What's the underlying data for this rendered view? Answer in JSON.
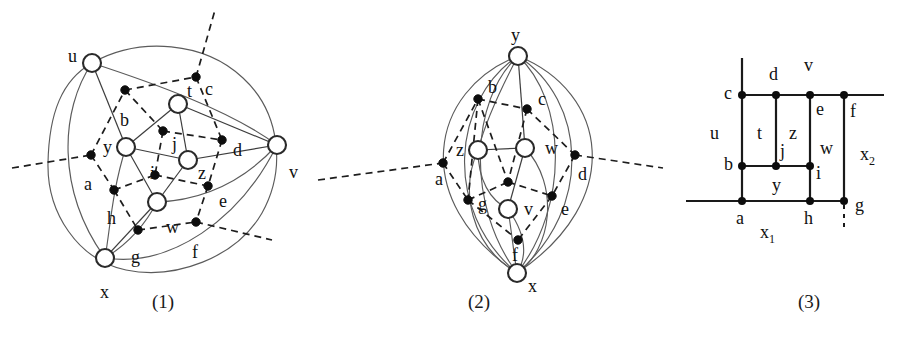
{
  "figure": {
    "kind": "three-panel graph embedding diagram",
    "captions": [
      {
        "text": "(1)",
        "x": 152,
        "y": 300
      },
      {
        "text": "(2)",
        "x": 468,
        "y": 300
      },
      {
        "text": "(3)",
        "x": 798,
        "y": 300
      }
    ]
  },
  "panel1": {
    "caption": "(1)",
    "vertices": [
      {
        "id": "u",
        "label": "u",
        "cx": 92,
        "cy": 63,
        "r": 9,
        "lx": 68,
        "ly": 47
      },
      {
        "id": "t",
        "label": "t",
        "cx": 178,
        "cy": 104,
        "r": 9,
        "lx": 187,
        "ly": 82
      },
      {
        "id": "y",
        "label": "y",
        "cx": 126,
        "cy": 147,
        "r": 9,
        "lx": 103,
        "ly": 138
      },
      {
        "id": "z",
        "label": "z",
        "cx": 188,
        "cy": 160,
        "r": 9,
        "lx": 198,
        "ly": 164
      },
      {
        "id": "v",
        "label": "v",
        "cx": 277,
        "cy": 145,
        "r": 9,
        "lx": 289,
        "ly": 163
      },
      {
        "id": "w",
        "label": "w",
        "cx": 157,
        "cy": 202,
        "r": 9,
        "lx": 166,
        "ly": 218
      },
      {
        "id": "x",
        "label": "x",
        "cx": 105,
        "cy": 258,
        "r": 9,
        "lx": 100,
        "ly": 283
      }
    ],
    "edge_dots": [
      {
        "id": "a",
        "label": "a",
        "cx": 91,
        "cy": 155,
        "lx": 84,
        "ly": 175
      },
      {
        "id": "b",
        "label": "b",
        "cx": 125,
        "cy": 90,
        "lx": 120,
        "ly": 111
      },
      {
        "id": "c",
        "label": "c",
        "cx": 196,
        "cy": 77,
        "lx": 205,
        "ly": 80
      },
      {
        "id": "d",
        "label": "d",
        "cx": 222,
        "cy": 140,
        "lx": 233,
        "ly": 141
      },
      {
        "id": "e",
        "label": "e",
        "cx": 208,
        "cy": 186,
        "lx": 219,
        "ly": 192
      },
      {
        "id": "f",
        "label": "f",
        "cx": 196,
        "cy": 222,
        "lx": 192,
        "ly": 243
      },
      {
        "id": "g",
        "label": "g",
        "cx": 138,
        "cy": 230,
        "lx": 131,
        "ly": 248
      },
      {
        "id": "h",
        "label": "h",
        "cx": 114,
        "cy": 190,
        "lx": 107,
        "ly": 209
      },
      {
        "id": "i",
        "label": "i",
        "cx": 155,
        "cy": 175,
        "lx": 150,
        "ly": 164
      },
      {
        "id": "j",
        "label": "j",
        "cx": 163,
        "cy": 131,
        "lx": 172,
        "ly": 135
      }
    ]
  },
  "panel2": {
    "caption": "(2)",
    "vertices": [
      {
        "id": "y",
        "label": "y",
        "cx": 518,
        "cy": 56,
        "r": 9,
        "lx": 511,
        "ly": 38
      },
      {
        "id": "z",
        "label": "z",
        "cx": 478,
        "cy": 150,
        "r": 9,
        "lx": 458,
        "ly": 153
      },
      {
        "id": "w",
        "label": "w",
        "cx": 525,
        "cy": 148,
        "r": 9,
        "lx": 545,
        "ly": 150
      },
      {
        "id": "v",
        "label": "v",
        "cx": 508,
        "cy": 209,
        "r": 9,
        "lx": 524,
        "ly": 213
      },
      {
        "id": "x",
        "label": "x",
        "cx": 517,
        "cy": 273,
        "r": 9,
        "lx": 527,
        "ly": 290
      }
    ],
    "edge_dots": [
      {
        "id": "a",
        "label": "a",
        "cx": 443,
        "cy": 163,
        "lx": 437,
        "ly": 183
      },
      {
        "id": "b",
        "label": "b",
        "cx": 478,
        "cy": 99,
        "lx": 489,
        "ly": 92
      },
      {
        "id": "c",
        "label": "c",
        "cx": 527,
        "cy": 109,
        "lx": 538,
        "ly": 103
      },
      {
        "id": "d",
        "label": "d",
        "cx": 575,
        "cy": 155,
        "lx": 578,
        "ly": 178
      },
      {
        "id": "e",
        "label": "e",
        "cx": 552,
        "cy": 196,
        "lx": 561,
        "ly": 212
      },
      {
        "id": "f",
        "label": "f",
        "cx": 518,
        "cy": 240,
        "lx": 513,
        "ly": 261
      },
      {
        "id": "g",
        "label": "g",
        "cx": 468,
        "cy": 200,
        "lx": 478,
        "ly": 207
      },
      {
        "id": "n",
        "label": "",
        "cx": 508,
        "cy": 182,
        "lx": 0,
        "ly": 0
      }
    ]
  },
  "panel3": {
    "caption": "(3)",
    "grid_nodes": [
      {
        "id": "c",
        "label": "c",
        "cx": 742,
        "cy": 95,
        "lx": 727,
        "ly": 90
      },
      {
        "id": "d",
        "label": "d",
        "cx": 776,
        "cy": 95,
        "lx": 770,
        "ly": 78
      },
      {
        "id": "v",
        "label": "v",
        "cx": 810,
        "cy": 95,
        "lx": 805,
        "ly": 70
      },
      {
        "id": "e",
        "label": "e",
        "cx": 810,
        "cy": 95,
        "lx": 816,
        "ly": 110
      },
      {
        "id": "f",
        "label": "f",
        "cx": 844,
        "cy": 95,
        "lx": 850,
        "ly": 112
      },
      {
        "id": "b",
        "label": "b",
        "cx": 742,
        "cy": 166,
        "lx": 727,
        "ly": 162
      },
      {
        "id": "j",
        "label": "j",
        "cx": 776,
        "cy": 166,
        "lx": 780,
        "ly": 152
      },
      {
        "id": "i",
        "label": "i",
        "cx": 810,
        "cy": 166,
        "lx": 816,
        "ly": 172
      },
      {
        "id": "a",
        "label": "a",
        "cx": 742,
        "cy": 201,
        "lx": 736,
        "ly": 220
      },
      {
        "id": "h",
        "label": "h",
        "cx": 810,
        "cy": 201,
        "lx": 806,
        "ly": 220
      },
      {
        "id": "g",
        "label": "g",
        "cx": 844,
        "cy": 201,
        "lx": 855,
        "ly": 207
      }
    ],
    "region_labels": [
      {
        "id": "u",
        "label": "u",
        "lx": 710,
        "ly": 135
      },
      {
        "id": "t",
        "label": "t",
        "lx": 757,
        "ly": 135
      },
      {
        "id": "z",
        "label": "z",
        "lx": 791,
        "ly": 135
      },
      {
        "id": "w",
        "label": "w",
        "lx": 823,
        "ly": 150
      },
      {
        "id": "y",
        "label": "y",
        "lx": 773,
        "ly": 185
      },
      {
        "id": "x1",
        "label": "x",
        "sub": "1",
        "lx": 764,
        "ly": 232
      },
      {
        "id": "x2",
        "label": "x",
        "sub": "2",
        "lx": 862,
        "ly": 155
      }
    ]
  }
}
